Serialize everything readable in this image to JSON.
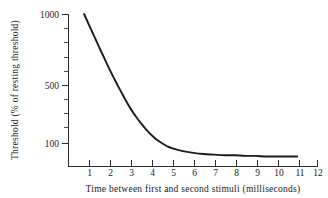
{
  "chart_data": {
    "type": "line",
    "title": "",
    "xlabel": "Time between first and second stimuli (milliseconds)",
    "ylabel": "Threshold (% of resting threshold)",
    "xlim": [
      0,
      12
    ],
    "ylim": [
      100,
      1000
    ],
    "yscale": "log",
    "grid": false,
    "legend": null,
    "xticks": [
      1,
      2,
      3,
      4,
      5,
      6,
      7,
      8,
      9,
      10,
      11,
      12
    ],
    "xtick_labels": [
      "1",
      "2",
      "3",
      "4",
      "5",
      "6",
      "7",
      "8",
      "9",
      "10",
      "11",
      "12"
    ],
    "yticks": [
      100,
      500,
      1000
    ],
    "ytick_labels": [
      "100",
      "500",
      "1000"
    ],
    "y_minor_ticks": [
      150,
      200,
      250,
      300,
      400,
      600,
      700,
      800,
      900
    ],
    "series": [
      {
        "name": "refractory-threshold-decay",
        "x": [
          0.75,
          1.0,
          1.25,
          1.5,
          1.75,
          2.0,
          2.25,
          2.5,
          2.75,
          3.0,
          3.25,
          3.5,
          3.75,
          4.0,
          4.25,
          4.5,
          4.75,
          5.0,
          5.5,
          6.0,
          6.5,
          7.0,
          7.5,
          8.0,
          8.5,
          9.0,
          9.5,
          10.0,
          10.5,
          11.0
        ],
        "y": [
          1000,
          830,
          690,
          575,
          480,
          402,
          340,
          290,
          248,
          215,
          190,
          170,
          154,
          141,
          131,
          124,
          118,
          114,
          109,
          106,
          104,
          103,
          102,
          102,
          101,
          101,
          100,
          100,
          100,
          100
        ]
      }
    ],
    "annotations": []
  },
  "axis": {
    "y_labels": {
      "top": "1000",
      "mid": "500",
      "bottom": "100"
    },
    "y_title": "Threshold (% of resting threshold)",
    "x_title": "Time between first and second stimuli (milliseconds)",
    "x_labels": [
      "1",
      "2",
      "3",
      "4",
      "5",
      "6",
      "7",
      "8",
      "9",
      "10",
      "11",
      "12"
    ]
  },
  "colors": {
    "curve": "#1b1b1b",
    "axis": "#2b2b2b",
    "text": "#1a1a1a",
    "background": "#ffffff"
  }
}
